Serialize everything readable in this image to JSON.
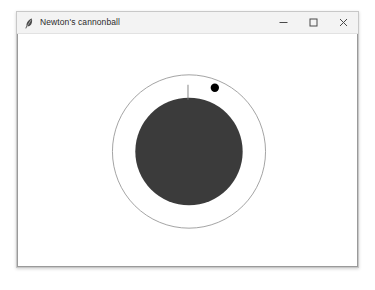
{
  "window": {
    "title": "Newton's cannonball",
    "icon": "feather-icon",
    "controls": [
      {
        "name": "minimize-button",
        "glyph": "minimize-icon",
        "label": "Minimize"
      },
      {
        "name": "maximize-button",
        "glyph": "maximize-icon",
        "label": "Maximize"
      },
      {
        "name": "close-button",
        "glyph": "close-icon",
        "label": "Close"
      }
    ],
    "background_color": "#ffffff",
    "titlebar_color": "#f3f3f3",
    "border_color": "#c8c8c8"
  },
  "simulation": {
    "name": "newtons-cannonball-simulation",
    "canvas_background": "#ffffff",
    "planet": {
      "label": "planet",
      "center_x": 172,
      "center_y": 118,
      "radius": 54,
      "fill_color": "#3b3b3b"
    },
    "orbit": {
      "label": "orbit-path",
      "center_x": 172,
      "center_y": 118,
      "radius": 77,
      "stroke_color": "#8c8c8c",
      "stroke_width": 0.8
    },
    "cannon": {
      "label": "cannon-tower",
      "x": 171,
      "y_top": 51,
      "y_bottom": 66,
      "stroke_color": "#7a7a7a",
      "stroke_width": 0.9
    },
    "cannonball": {
      "label": "cannonball",
      "center_x": 198,
      "center_y": 54,
      "radius": 4.2,
      "fill_color": "#000000"
    }
  }
}
